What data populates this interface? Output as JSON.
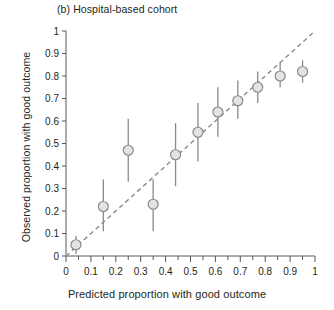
{
  "figure": {
    "panel_title": "(b) Hospital-based cohort",
    "colors": {
      "marker_fill": "#e3e3e3",
      "marker_stroke": "#8a8a8a",
      "error_bar": "#8a8a8a",
      "reference_line": "#8a8a8a",
      "axis": "#58595b",
      "text": "#231f20",
      "background": "#ffffff"
    }
  },
  "chart_data": {
    "type": "scatter",
    "title": "(b) Hospital-based cohort",
    "xlabel": "Predicted proportion with good outcome",
    "ylabel": "Observed proportion with good outcome",
    "xlim": [
      0,
      1
    ],
    "ylim": [
      0,
      1
    ],
    "grid": false,
    "legend": null,
    "xticks": [
      0,
      0.1,
      0.2,
      0.3,
      0.4,
      0.5,
      0.6,
      0.7,
      0.8,
      0.9,
      1
    ],
    "xtick_labels": [
      "0",
      "0.1",
      "0.2",
      "0.3",
      "0.4",
      "0.5",
      "0.6",
      "0.7",
      "0.8",
      "0.9",
      "1"
    ],
    "x_minor_tick_interval": 0.05,
    "yticks": [
      0,
      0.1,
      0.2,
      0.3,
      0.4,
      0.5,
      0.6,
      0.7,
      0.8,
      0.9,
      1
    ],
    "ytick_labels": [
      "0",
      "0.1",
      "0.2",
      "0.3",
      "0.4",
      "0.5",
      "0.6",
      "0.7",
      "0.8",
      "0.9",
      "1"
    ],
    "reference_line": {
      "style": "dashed",
      "from": [
        0.0,
        0.0
      ],
      "to": [
        1.0,
        1.0
      ],
      "label": "ideal calibration (y = x)"
    },
    "series": [
      {
        "name": "Observed vs predicted proportion with good outcome",
        "marker": "circle",
        "error_bars": "vertical 95% CI",
        "points": [
          {
            "x": 0.04,
            "y": 0.05,
            "ylow": 0.01,
            "yhigh": 0.09
          },
          {
            "x": 0.15,
            "y": 0.22,
            "ylow": 0.11,
            "yhigh": 0.34
          },
          {
            "x": 0.25,
            "y": 0.47,
            "ylow": 0.33,
            "yhigh": 0.61
          },
          {
            "x": 0.35,
            "y": 0.23,
            "ylow": 0.11,
            "yhigh": 0.34
          },
          {
            "x": 0.44,
            "y": 0.45,
            "ylow": 0.31,
            "yhigh": 0.59
          },
          {
            "x": 0.53,
            "y": 0.55,
            "ylow": 0.42,
            "yhigh": 0.68
          },
          {
            "x": 0.61,
            "y": 0.64,
            "ylow": 0.53,
            "yhigh": 0.75
          },
          {
            "x": 0.69,
            "y": 0.69,
            "ylow": 0.61,
            "yhigh": 0.78
          },
          {
            "x": 0.77,
            "y": 0.75,
            "ylow": 0.68,
            "yhigh": 0.82
          },
          {
            "x": 0.86,
            "y": 0.8,
            "ylow": 0.75,
            "yhigh": 0.86
          },
          {
            "x": 0.95,
            "y": 0.82,
            "ylow": 0.77,
            "yhigh": 0.87
          }
        ]
      }
    ]
  }
}
